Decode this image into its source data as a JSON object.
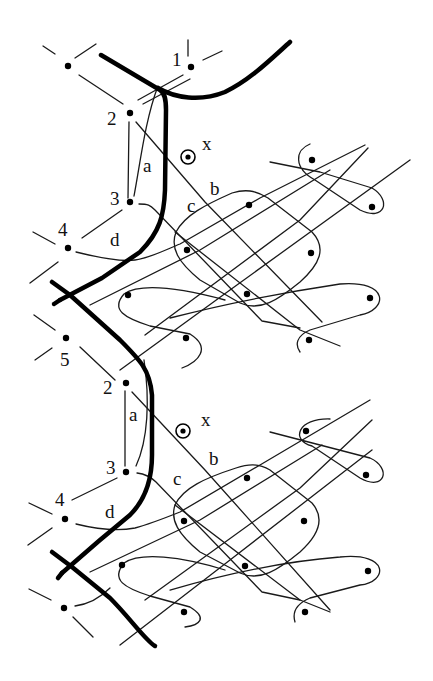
{
  "diagram": {
    "title": "",
    "colors": {
      "ink": "#1a1a1a",
      "thick_line": "#000000",
      "background": "#ffffff"
    },
    "upper_unit": {
      "node_labels": {
        "n1": "1",
        "n2": "2",
        "n3": "3",
        "n4": "4",
        "n5": "5"
      },
      "edge_labels": {
        "a": "a",
        "b": "b",
        "c": "c",
        "d": "d"
      },
      "marker_label": "x"
    },
    "lower_unit": {
      "node_labels": {
        "n2": "2",
        "n3": "3",
        "n4": "4"
      },
      "edge_labels": {
        "a": "a",
        "b": "b",
        "c": "c",
        "d": "d"
      },
      "marker_label": "x"
    }
  }
}
